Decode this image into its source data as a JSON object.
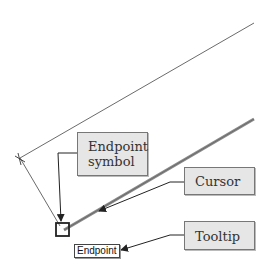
{
  "diagram": {
    "callouts": {
      "endpoint_symbol": "Endpoint symbol",
      "endpoint_symbol_line1": "Endpoint",
      "endpoint_symbol_line2": "symbol",
      "cursor": "Cursor",
      "tooltip": "Tooltip"
    },
    "tooltip_text": "Endpoint",
    "colors": {
      "callout_fill": "#e6e6e6",
      "callout_border": "#777777",
      "line": "#333333",
      "thick_line": "#8a8a8a",
      "arrow": "#222222"
    }
  }
}
